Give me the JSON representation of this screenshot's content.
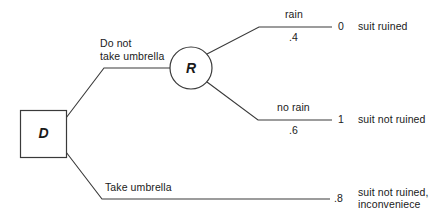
{
  "diagram": {
    "type": "decision-tree",
    "nodes": [
      {
        "id": "D",
        "kind": "decision",
        "label": "D",
        "shape": "square"
      },
      {
        "id": "R",
        "kind": "chance",
        "label": "R",
        "shape": "circle"
      }
    ],
    "decision_branches": [
      {
        "id": "no-umbrella",
        "label_line1": "Do not",
        "label_line2": "take umbrella"
      },
      {
        "id": "take-umbrella",
        "label_line1": "Take umbrella",
        "label_line2": ""
      }
    ],
    "chance_branches": [
      {
        "id": "rain",
        "label": "rain",
        "probability": ".4",
        "payoff": "0",
        "outcome_line1": "suit ruined",
        "outcome_line2": ""
      },
      {
        "id": "no-rain",
        "label": "no rain",
        "probability": ".6",
        "payoff": "1",
        "outcome_line1": "suit not ruined",
        "outcome_line2": ""
      }
    ],
    "terminal_branches": [
      {
        "id": "umbrella-outcome",
        "payoff": ".8",
        "outcome_line1": "suit not ruined,",
        "outcome_line2": "inconveniece"
      }
    ],
    "colors": {
      "stroke": "#3a3a3a",
      "text": "#1a1a1a",
      "background": "#ffffff"
    }
  }
}
